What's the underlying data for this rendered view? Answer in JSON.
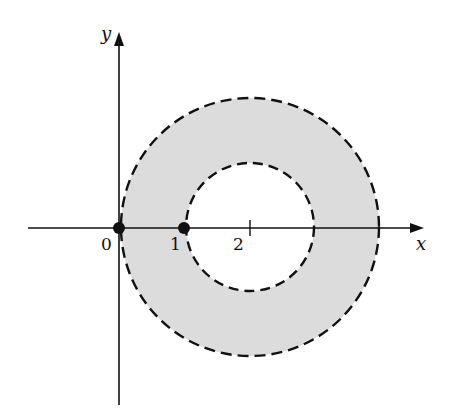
{
  "figure": {
    "x_axis_label": "x",
    "y_axis_label": "y",
    "tick_labels": [
      "0",
      "1",
      "2"
    ],
    "points": [
      {
        "label": "origin",
        "x": 0,
        "y": 0
      },
      {
        "label": "one",
        "x": 1,
        "y": 0
      }
    ],
    "outer_circle": {
      "center": [
        2,
        0
      ],
      "radius": 2,
      "style": "dashed"
    },
    "inner_circle": {
      "center": [
        2,
        0
      ],
      "radius": 1,
      "style": "dashed"
    },
    "fill_color": "#dcdcdc",
    "line_color": "#111111"
  }
}
